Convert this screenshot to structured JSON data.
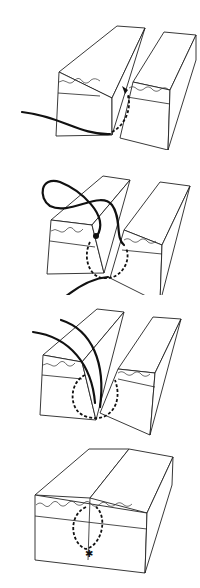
{
  "figure": {
    "steps": [
      {
        "index": 1,
        "label": "",
        "caption": "Needle enters deep in wound and exits at dermis on far side"
      },
      {
        "index": 2,
        "label": "",
        "caption": "Needle passes through near side from dermis to deep tissue"
      },
      {
        "index": 3,
        "label": "",
        "caption": "Both thread ends pulled upward, loop buried in wound"
      },
      {
        "index": 4,
        "label": "",
        "caption": "Wound edges approximated, knot buried at depth"
      }
    ],
    "colors": {
      "line": "#222222",
      "thread": "#111111",
      "background": "#ffffff"
    }
  }
}
